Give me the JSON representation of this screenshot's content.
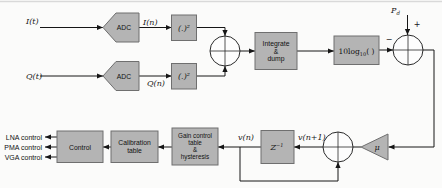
{
  "colors": {
    "background": "#fbfbfa",
    "block_fill": "#b4b4b4",
    "block_border": "#6f6f6f",
    "line": "#161616",
    "sum_fill": "#fdfdfd",
    "top_rule": "#d9d9d9"
  },
  "signals": {
    "i_input": "I(t)",
    "i_sampled": "I(n)",
    "q_input": "Q(t)",
    "q_sampled": "Q(n)",
    "square_top": "(.)²",
    "square_bottom": "(.)²",
    "pd_base": "P",
    "pd_sub": "d",
    "plus_sign": "+",
    "minus_sign": "−",
    "mu_gain": "μ",
    "v_next": "v(n+1)",
    "v_current": "v(n)",
    "z_base": "Z",
    "z_sup": "−1"
  },
  "blocks": {
    "adc_top": "ADC",
    "adc_bottom": "ADC",
    "integrate_lines": [
      "Integrate",
      "&",
      "dump"
    ],
    "log_base": "10log",
    "log_sub": "10",
    "log_tail": "( )",
    "gain_lines": [
      "Gain control",
      "table",
      "&",
      "hysteresis"
    ],
    "calibration_lines": [
      "Calibration",
      "table"
    ],
    "control": "Control"
  },
  "outputs": [
    "LNA control",
    "PMA control",
    "VGA control"
  ]
}
